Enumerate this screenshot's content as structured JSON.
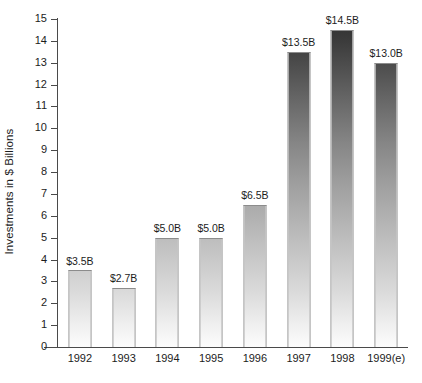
{
  "chart_data": {
    "type": "bar",
    "title": "",
    "xlabel": "",
    "ylabel": "Investments in $ Billions",
    "categories": [
      "1992",
      "1993",
      "1994",
      "1995",
      "1996",
      "1997",
      "1998",
      "1999(e)"
    ],
    "values": [
      3.5,
      2.7,
      5.0,
      5.0,
      6.5,
      13.5,
      14.5,
      13.0
    ],
    "data_labels": [
      "$3.5B",
      "$2.7B",
      "$5.0B",
      "$5.0B",
      "$6.5B",
      "$13.5B",
      "$14.5B",
      "$13.0B"
    ],
    "ylim": [
      0,
      15
    ],
    "ytick_step": 1,
    "ytick_labels": [
      "15",
      "14",
      "13",
      "12",
      "11",
      "10",
      "9",
      "8",
      "7",
      "6",
      "5",
      "4",
      "3",
      "2",
      "1",
      "0"
    ],
    "grid": false,
    "legend": null,
    "series": [
      {
        "name": "Investments",
        "values": [
          3.5,
          2.7,
          5.0,
          5.0,
          6.5,
          13.5,
          14.5,
          13.0
        ]
      }
    ],
    "colors": {
      "background": "#ffffff",
      "axis": "#4a4a4a",
      "text": "#1c1c1c",
      "bar_outline": "#8c8c8c",
      "bar_gradient_top": "#2f2f2f",
      "bar_gradient_bottom": "#fcfcfc"
    }
  }
}
